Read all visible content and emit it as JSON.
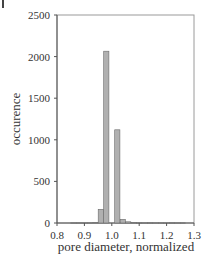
{
  "chart_data": {
    "type": "bar",
    "title": "",
    "xlabel": "pore diameter, normalized",
    "ylabel": "occurence",
    "xlim": [
      0.8,
      1.3
    ],
    "ylim": [
      0,
      2500
    ],
    "xticks": [
      "0.8",
      "0.9",
      "1.0",
      "1.1",
      "1.2",
      "1.3"
    ],
    "yticks": [
      "0",
      "500",
      "1000",
      "1500",
      "2000",
      "2500"
    ],
    "grid": false,
    "legend": null,
    "bar_color": "#b0b0b0",
    "bar_edge_color": "#6a6a6a",
    "x": [
      0.86,
      0.88,
      0.9,
      0.92,
      0.94,
      0.96,
      0.98,
      1.0,
      1.02,
      1.04,
      1.06,
      1.08,
      1.1,
      1.12,
      1.14,
      1.16,
      1.18,
      1.2,
      1.22,
      1.24,
      1.26
    ],
    "values": [
      3,
      2,
      3,
      3,
      5,
      165,
      2065,
      0,
      1120,
      45,
      15,
      5,
      4,
      3,
      4,
      3,
      3,
      2,
      4,
      3,
      3
    ]
  },
  "panel_marker": "|"
}
